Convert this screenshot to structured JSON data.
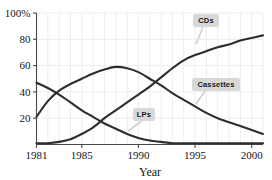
{
  "chart_data": {
    "type": "line",
    "title": "",
    "xlabel": "Year",
    "ylabel": "",
    "xlim": [
      1981,
      2001
    ],
    "ylim": [
      0,
      100
    ],
    "grid": true,
    "legend_position": "inline-callouts",
    "x_tick_labels": [
      "1981",
      "1985",
      "1990",
      "1995",
      "2000"
    ],
    "x_tick_values": [
      1981,
      1985,
      1990,
      1995,
      2000
    ],
    "y_tick_labels": [
      "20",
      "40",
      "60",
      "80",
      "100%"
    ],
    "y_tick_values": [
      20,
      40,
      60,
      80,
      100
    ],
    "x": [
      1981,
      1982,
      1983,
      1984,
      1985,
      1986,
      1987,
      1988,
      1989,
      1990,
      1991,
      1992,
      1993,
      1994,
      1995,
      1996,
      1997,
      1998,
      1999,
      2000,
      2001
    ],
    "series": [
      {
        "name": "LPs",
        "label": "LPs",
        "values": [
          47,
          43,
          38,
          32,
          26,
          21,
          16,
          12,
          8,
          5,
          3,
          2,
          1,
          1,
          1,
          1,
          1,
          1,
          1,
          1,
          1
        ]
      },
      {
        "name": "Cassettes",
        "label": "Cassettes",
        "values": [
          21,
          33,
          41,
          46,
          50,
          54,
          57,
          59,
          58,
          55,
          50,
          45,
          39,
          34,
          29,
          24,
          20,
          17,
          14,
          11,
          8
        ]
      },
      {
        "name": "CDs",
        "label": "CDs",
        "values": [
          1,
          1,
          2,
          4,
          8,
          13,
          20,
          26,
          32,
          38,
          44,
          51,
          58,
          64,
          68,
          71,
          74,
          76,
          79,
          81,
          83
        ]
      }
    ],
    "annotations": [
      {
        "name": "CDs",
        "text": "CDs"
      },
      {
        "name": "Cassettes",
        "text": "Cassettes"
      },
      {
        "name": "LPs",
        "text": "LPs"
      }
    ],
    "colors": {
      "line": "#2e2e2e",
      "grid": "#ededed",
      "axis": "#4a4a4a",
      "callout_box": "#d8d8d8",
      "background": "#ffffff"
    }
  }
}
